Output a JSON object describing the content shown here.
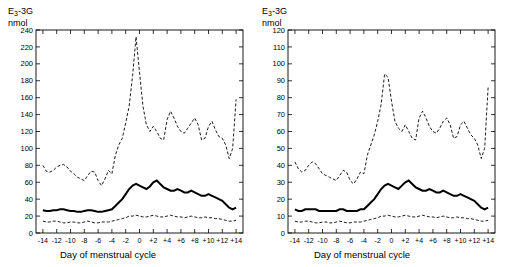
{
  "chart_data": [
    {
      "type": "line",
      "panel": "left",
      "title": "E3-3G",
      "title_main": "E",
      "title_sub": "3",
      "title_rest": "-3G",
      "ylabel": "nmol",
      "xlabel": "Day of menstrual cycle",
      "ylim": [
        0,
        240
      ],
      "yticks": [
        0,
        20,
        40,
        60,
        80,
        100,
        120,
        140,
        160,
        180,
        200,
        220,
        240
      ],
      "xlim": [
        -15,
        15
      ],
      "xticks": [
        -14,
        -12,
        -10,
        -8,
        -6,
        -4,
        -2,
        0,
        2,
        4,
        6,
        8,
        10,
        12,
        14
      ],
      "xtick_labels": [
        "-14",
        "-12",
        "-10",
        "-8",
        "-6",
        "-4",
        "-2",
        "0",
        "+2",
        "+4",
        "+6",
        "+8",
        "+10",
        "+12",
        "+14"
      ],
      "grid": false,
      "legend": "none",
      "series": [
        {
          "name": "upper-percentile",
          "style": "dashed",
          "x": [
            -14,
            -13.5,
            -13,
            -12.5,
            -12,
            -11.5,
            -11,
            -10.5,
            -10,
            -9.5,
            -9,
            -8.5,
            -8,
            -7.5,
            -7,
            -6.5,
            -6,
            -5.5,
            -5,
            -4.5,
            -4,
            -3.5,
            -3,
            -2.5,
            -2,
            -1.5,
            -1,
            -0.5,
            0,
            0.5,
            1,
            1.5,
            2,
            2.5,
            3,
            3.5,
            4,
            4.5,
            5,
            5.5,
            6,
            6.5,
            7,
            7.5,
            8,
            8.5,
            9,
            9.5,
            10,
            10.5,
            11,
            11.5,
            12,
            12.5,
            13,
            13.5,
            14
          ],
          "values": [
            80,
            73,
            72,
            74,
            78,
            80,
            81,
            78,
            73,
            70,
            66,
            64,
            62,
            68,
            73,
            72,
            62,
            56,
            64,
            74,
            70,
            92,
            104,
            112,
            130,
            150,
            186,
            232,
            190,
            150,
            128,
            120,
            126,
            120,
            112,
            110,
            134,
            144,
            136,
            126,
            120,
            118,
            124,
            130,
            136,
            128,
            110,
            112,
            126,
            132,
            122,
            114,
            112,
            104,
            88,
            100,
            158
          ]
        },
        {
          "name": "median",
          "style": "solid",
          "x": [
            -14,
            -13.5,
            -13,
            -12.5,
            -12,
            -11.5,
            -11,
            -10.5,
            -10,
            -9.5,
            -9,
            -8.5,
            -8,
            -7.5,
            -7,
            -6.5,
            -6,
            -5.5,
            -5,
            -4.5,
            -4,
            -3.5,
            -3,
            -2.5,
            -2,
            -1.5,
            -1,
            -0.5,
            0,
            0.5,
            1,
            1.5,
            2,
            2.5,
            3,
            3.5,
            4,
            4.5,
            5,
            5.5,
            6,
            6.5,
            7,
            7.5,
            8,
            8.5,
            9,
            9.5,
            10,
            10.5,
            11,
            11.5,
            12,
            12.5,
            13,
            13.5,
            14
          ],
          "values": [
            27,
            26,
            26,
            27,
            27,
            28,
            28,
            27,
            26,
            26,
            25,
            25,
            26,
            27,
            27,
            26,
            25,
            25,
            26,
            27,
            28,
            32,
            36,
            40,
            46,
            52,
            56,
            58,
            56,
            54,
            52,
            55,
            60,
            62,
            58,
            54,
            52,
            50,
            50,
            52,
            50,
            48,
            48,
            50,
            48,
            46,
            44,
            44,
            46,
            44,
            42,
            40,
            38,
            34,
            30,
            28,
            30
          ]
        },
        {
          "name": "lower-percentile",
          "style": "dashed",
          "x": [
            -14,
            -13.5,
            -13,
            -12.5,
            -12,
            -11.5,
            -11,
            -10.5,
            -10,
            -9.5,
            -9,
            -8.5,
            -8,
            -7.5,
            -7,
            -6.5,
            -6,
            -5.5,
            -5,
            -4.5,
            -4,
            -3.5,
            -3,
            -2.5,
            -2,
            -1.5,
            -1,
            -0.5,
            0,
            0.5,
            1,
            1.5,
            2,
            2.5,
            3,
            3.5,
            4,
            4.5,
            5,
            5.5,
            6,
            6.5,
            7,
            7.5,
            8,
            8.5,
            9,
            9.5,
            10,
            10.5,
            11,
            11.5,
            12,
            12.5,
            13,
            13.5,
            14
          ],
          "values": [
            14,
            13,
            13,
            14,
            14,
            13,
            12,
            12,
            13,
            13,
            12,
            12,
            13,
            14,
            13,
            12,
            12,
            13,
            13,
            13,
            14,
            15,
            16,
            17,
            18,
            20,
            20,
            21,
            20,
            19,
            19,
            20,
            21,
            20,
            19,
            19,
            20,
            21,
            20,
            19,
            19,
            18,
            19,
            20,
            19,
            18,
            18,
            19,
            18,
            18,
            17,
            17,
            16,
            15,
            14,
            14,
            15
          ]
        }
      ]
    },
    {
      "type": "line",
      "panel": "right",
      "title": "E3-3G",
      "title_main": "E",
      "title_sub": "3",
      "title_rest": "-3G",
      "ylabel": "nmol",
      "xlabel": "Day of menstrual cycle",
      "ylim": [
        0,
        120
      ],
      "yticks": [
        0,
        10,
        20,
        30,
        40,
        50,
        60,
        70,
        80,
        90,
        100,
        110,
        120
      ],
      "xlim": [
        -15,
        15
      ],
      "xticks": [
        -14,
        -12,
        -10,
        -8,
        -6,
        -4,
        -2,
        0,
        2,
        4,
        6,
        8,
        10,
        12,
        14
      ],
      "xtick_labels": [
        "-14",
        "-12",
        "-10",
        "-8",
        "-6",
        "-4",
        "-2",
        "0",
        "+2",
        "+4",
        "+6",
        "+8",
        "+10",
        "+12",
        "+14"
      ],
      "grid": false,
      "legend": "none",
      "series": [
        {
          "name": "upper-percentile",
          "style": "dashed",
          "x": [
            -14,
            -13.5,
            -13,
            -12.5,
            -12,
            -11.5,
            -11,
            -10.5,
            -10,
            -9.5,
            -9,
            -8.5,
            -8,
            -7.5,
            -7,
            -6.5,
            -6,
            -5.5,
            -5,
            -4.5,
            -4,
            -3.5,
            -3,
            -2.5,
            -2,
            -1.5,
            -1,
            -0.5,
            0,
            0.5,
            1,
            1.5,
            2,
            2.5,
            3,
            3.5,
            4,
            4.5,
            5,
            5.5,
            6,
            6.5,
            7,
            7.5,
            8,
            8.5,
            9,
            9.5,
            10,
            10.5,
            11,
            11.5,
            12,
            12.5,
            13,
            13.5,
            14
          ],
          "values": [
            42,
            38,
            36,
            37,
            40,
            42,
            41,
            38,
            35,
            34,
            33,
            32,
            31,
            34,
            37,
            36,
            31,
            29,
            32,
            36,
            35,
            46,
            52,
            58,
            66,
            76,
            94,
            92,
            78,
            66,
            62,
            60,
            64,
            60,
            56,
            55,
            68,
            72,
            68,
            63,
            60,
            59,
            62,
            66,
            68,
            64,
            56,
            57,
            64,
            66,
            62,
            58,
            56,
            52,
            44,
            50,
            86
          ]
        },
        {
          "name": "median",
          "style": "solid",
          "x": [
            -14,
            -13.5,
            -13,
            -12.5,
            -12,
            -11.5,
            -11,
            -10.5,
            -10,
            -9.5,
            -9,
            -8.5,
            -8,
            -7.5,
            -7,
            -6.5,
            -6,
            -5.5,
            -5,
            -4.5,
            -4,
            -3.5,
            -3,
            -2.5,
            -2,
            -1.5,
            -1,
            -0.5,
            0,
            0.5,
            1,
            1.5,
            2,
            2.5,
            3,
            3.5,
            4,
            4.5,
            5,
            5.5,
            6,
            6.5,
            7,
            7.5,
            8,
            8.5,
            9,
            9.5,
            10,
            10.5,
            11,
            11.5,
            12,
            12.5,
            13,
            13.5,
            14
          ],
          "values": [
            14,
            13,
            13,
            14,
            14,
            14,
            14,
            13,
            13,
            13,
            13,
            13,
            13,
            14,
            14,
            13,
            13,
            13,
            13,
            14,
            14,
            16,
            18,
            20,
            23,
            26,
            28,
            29,
            28,
            27,
            26,
            28,
            30,
            31,
            29,
            27,
            26,
            25,
            25,
            26,
            25,
            24,
            24,
            25,
            24,
            23,
            22,
            22,
            23,
            22,
            21,
            20,
            19,
            17,
            15,
            14,
            15
          ]
        },
        {
          "name": "lower-percentile",
          "style": "dashed",
          "x": [
            -14,
            -13.5,
            -13,
            -12.5,
            -12,
            -11.5,
            -11,
            -10.5,
            -10,
            -9.5,
            -9,
            -8.5,
            -8,
            -7.5,
            -7,
            -6.5,
            -6,
            -5.5,
            -5,
            -4.5,
            -4,
            -3.5,
            -3,
            -2.5,
            -2,
            -1.5,
            -1,
            -0.5,
            0,
            0.5,
            1,
            1.5,
            2,
            2.5,
            3,
            3.5,
            4,
            4.5,
            5,
            5.5,
            6,
            6.5,
            7,
            7.5,
            8,
            8.5,
            9,
            9.5,
            10,
            10.5,
            11,
            11.5,
            12,
            12.5,
            13,
            13.5,
            14
          ],
          "values": [
            7,
            6.5,
            6.5,
            7,
            7,
            6.5,
            6,
            6,
            6.5,
            6.5,
            6,
            6,
            6.5,
            7,
            6.5,
            6,
            6,
            6.5,
            6.5,
            6.5,
            7,
            7.5,
            8,
            8.5,
            9,
            10,
            10,
            10.5,
            10,
            9.5,
            9.5,
            10,
            10.5,
            10,
            9.5,
            9.5,
            10,
            10.5,
            10,
            9.5,
            9.5,
            9,
            9.5,
            10,
            9.5,
            9,
            9,
            9.5,
            9,
            9,
            8.5,
            8.5,
            8,
            7.5,
            7,
            7,
            7.5
          ]
        }
      ]
    }
  ]
}
